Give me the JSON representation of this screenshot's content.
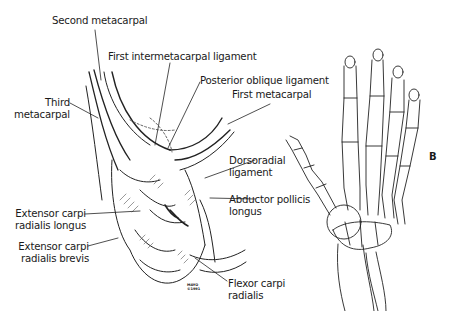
{
  "figure": {
    "panel_label": "B",
    "labels": [
      {
        "id": "second-metacarpal",
        "text": "Second metacarpal"
      },
      {
        "id": "first-intermetacarpal-ligament",
        "text": "First intermetacarpal ligament"
      },
      {
        "id": "posterior-oblique-ligament",
        "text": "Posterior oblique ligament"
      },
      {
        "id": "first-metacarpal",
        "text": "First metacarpal"
      },
      {
        "id": "third-metacarpal",
        "lines": [
          "Third",
          "metacarpal"
        ]
      },
      {
        "id": "dorsoradial-ligament",
        "lines": [
          "Dorsoradial",
          "ligament"
        ]
      },
      {
        "id": "abductor-pollicis-longus",
        "lines": [
          "Abductor pollicis",
          "longus"
        ]
      },
      {
        "id": "extensor-carpi-radialis-longus",
        "lines": [
          "Extensor carpi",
          "radialis longus"
        ]
      },
      {
        "id": "extensor-carpi-radialis-brevis",
        "lines": [
          "Extensor carpi",
          "radialis brevis"
        ]
      },
      {
        "id": "flexor-carpi-radialis",
        "lines": [
          "Flexor carpi",
          "radialis"
        ]
      }
    ],
    "signature": {
      "line1": "MAYO",
      "line2": "©1991"
    }
  }
}
